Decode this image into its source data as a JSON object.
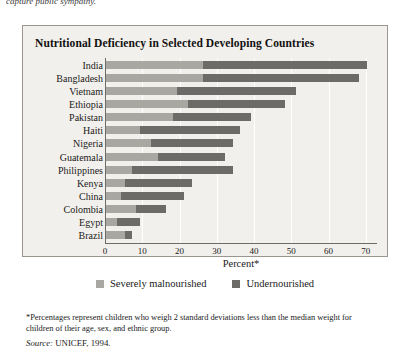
{
  "page": {
    "cut_text_above": "capture public sympathy."
  },
  "figure": {
    "title": "Nutritional Deficiency in Selected Developing Countries",
    "footnote": "*Percentages represent children who weigh 2 standard deviations less than the median weight for children of their age, sex, and ethnic group.",
    "source_label": "Source:",
    "source_text": "UNICEF, 1994.",
    "colors": {
      "severely_malnourished": "#a9a7a2",
      "undernourished": "#6d6b68",
      "panel_background": "#f2f0ec",
      "title_bar": "#2b2b2b",
      "axis": "#6f6b65",
      "gridline": "#ffffff"
    }
  },
  "chart_data": {
    "type": "bar",
    "orientation": "horizontal",
    "stacked": true,
    "title": "Nutritional Deficiency in Selected Developing Countries",
    "xlabel": "Percent*",
    "ylabel": "",
    "xlim": [
      0,
      73
    ],
    "xticks": [
      0,
      10,
      20,
      30,
      40,
      50,
      60,
      70
    ],
    "xtick_labels": [
      "0",
      "10",
      "20",
      "30",
      "40",
      "50",
      "60",
      "70"
    ],
    "grid": true,
    "grid_axis": "x",
    "legend_position": "bottom",
    "categories": [
      "India",
      "Bangladesh",
      "Vietnam",
      "Ethiopia",
      "Pakistan",
      "Haiti",
      "Nigeria",
      "Guatemala",
      "Philippines",
      "Kenya",
      "China",
      "Colombia",
      "Egypt",
      "Brazil"
    ],
    "series": [
      {
        "name": "Severely malnourished",
        "color": "#a9a7a2",
        "values": [
          26,
          26,
          19,
          22,
          18,
          9,
          12,
          14,
          7,
          5,
          4,
          8,
          3,
          5
        ]
      },
      {
        "name": "Undernourished",
        "color": "#6d6b68",
        "values": [
          44,
          42,
          32,
          26,
          21,
          27,
          22,
          18,
          27,
          18,
          17,
          8,
          6,
          2
        ]
      }
    ],
    "totals": [
      70,
      68,
      51,
      48,
      39,
      36,
      34,
      32,
      34,
      23,
      21,
      16,
      9,
      7
    ]
  }
}
